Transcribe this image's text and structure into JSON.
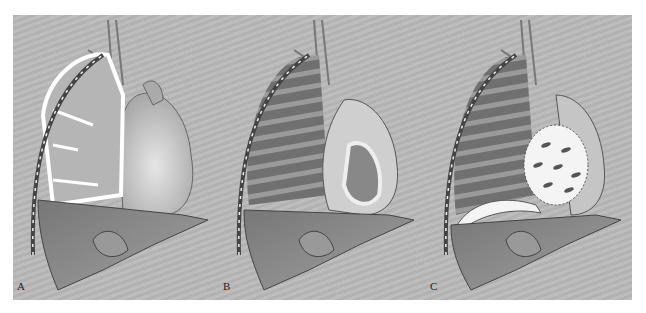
{
  "figure": {
    "background_color": "#b9b9b9",
    "panels": [
      {
        "label": "A",
        "description": "Thoracic cavity with lung and pleural space, heart, liver"
      },
      {
        "label": "B",
        "description": "Lung with rib shading, heart with pericardial layer exposed, liver"
      },
      {
        "label": "C",
        "description": "Lung with rib shading, heart covered by fenestrated patch, diaphragm highlighted"
      }
    ]
  }
}
